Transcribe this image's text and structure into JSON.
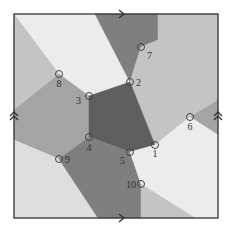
{
  "diagram": {
    "colors": {
      "pentagon": "#5e5e5e",
      "dark": "#7f7f7f",
      "mid": "#a4a4a4",
      "light": "#c4c4c4",
      "lighter": "#dedede",
      "lightest": "#ececec",
      "border": "#333333",
      "node_stroke": "#444444"
    },
    "nodes": [
      {
        "id": "1",
        "label": "1"
      },
      {
        "id": "2",
        "label": "2"
      },
      {
        "id": "3",
        "label": "3"
      },
      {
        "id": "4",
        "label": "4"
      },
      {
        "id": "5",
        "label": "5"
      },
      {
        "id": "6",
        "label": "6"
      },
      {
        "id": "7",
        "label": "7"
      },
      {
        "id": "8",
        "label": "8"
      },
      {
        "id": "9",
        "label": "9"
      },
      {
        "id": "10",
        "label": "10"
      }
    ],
    "edge_markers": {
      "top": "single-arrow-right",
      "bottom": "single-arrow-right",
      "left": "double-arrow-up",
      "right": "double-arrow-up"
    }
  }
}
